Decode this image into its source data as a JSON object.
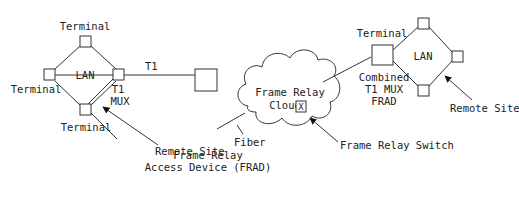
{
  "diagram": {
    "left_site": {
      "lan_label": "LAN",
      "terminal_top": "Terminal",
      "terminal_left": "Terminal",
      "terminal_bottom": "Terminal",
      "mux_line1": "T1",
      "mux_line2": "MUX",
      "remote_site": "Remote Site"
    },
    "link_t1": "T1",
    "frad": {
      "line1": "Frame Relay",
      "line2": "Access Device (FRAD)"
    },
    "fiber": "Fiber",
    "cloud": {
      "line1": "Frame Relay",
      "line2": "Cloud",
      "switch_glyph": "X"
    },
    "switch_label": "Frame Relay Switch",
    "right_site": {
      "terminal": "Terminal",
      "lan_label": "LAN",
      "combined_line1": "Combined",
      "combined_line2": "T1 MUX",
      "combined_line3": "FRAD",
      "remote_site": "Remote Site"
    }
  }
}
